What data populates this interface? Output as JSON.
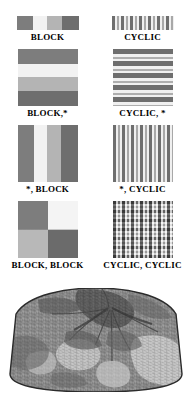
{
  "figure": {
    "background_color": "#ffffff",
    "width": 190,
    "height": 395
  },
  "pattern_grid": {
    "rows": [
      {
        "row_index": 1,
        "shape": "bar",
        "cells": [
          {
            "caption": "BLOCK",
            "boundary_type": "BLOCK",
            "axis": "1D-horizontal",
            "fill_class": "fill-block-h",
            "bands": [
              "#7d7d7d",
              "#f2f2f2",
              "#b4b4b4",
              "#6e6e6e"
            ]
          },
          {
            "caption": "CYCLIC",
            "boundary_type": "CYCLIC",
            "axis": "1D-horizontal",
            "fill_class": "fill-cyclic-h",
            "bands": [
              "#6e6e6e",
              "#efefef",
              "#a8a8a8",
              "#efefef"
            ]
          }
        ]
      },
      {
        "row_index": 2,
        "shape": "tile",
        "cells": [
          {
            "caption": "BLOCK,*",
            "boundary_type": "BLOCK",
            "axis": "vertical",
            "fill_class": "fill-block-v",
            "bands": [
              "#7d7d7d",
              "#f2f2f2",
              "#b4b4b4",
              "#6e6e6e"
            ]
          },
          {
            "caption": "CYCLIC, *",
            "boundary_type": "CYCLIC",
            "axis": "vertical",
            "fill_class": "fill-cyclic-v",
            "bands": [
              "#6e6e6e",
              "#f0f0f0",
              "#aeaeae",
              "#f0f0f0"
            ]
          }
        ]
      },
      {
        "row_index": 3,
        "shape": "tile",
        "cells": [
          {
            "caption": "*, BLOCK",
            "boundary_type": "BLOCK",
            "axis": "horizontal",
            "fill_class": "fill-block-h",
            "bands": [
              "#7d7d7d",
              "#f2f2f2",
              "#b4b4b4",
              "#6e6e6e"
            ]
          },
          {
            "caption": "*, CYCLIC",
            "boundary_type": "CYCLIC",
            "axis": "horizontal",
            "fill_class": "fill-cyclic-h",
            "bands": [
              "#6e6e6e",
              "#efefef",
              "#a8a8a8",
              "#efefef"
            ]
          }
        ]
      },
      {
        "row_index": 4,
        "shape": "tile",
        "cells": [
          {
            "caption": "BLOCK, BLOCK",
            "boundary_type": "BLOCK",
            "axis": "both",
            "fill_class": "fill-block-block",
            "quadrants": [
              "#7d7d7d",
              "#f4f4f4",
              "#b8b8b8",
              "#6b6b6b"
            ]
          },
          {
            "caption": "CYCLIC, CYCLIC",
            "boundary_type": "CYCLIC",
            "axis": "both",
            "fill_class": "fill-cyclic-cyclic",
            "base_color": "#9d9d9d"
          }
        ]
      }
    ]
  },
  "micrograph": {
    "description": "grain-structure micrograph",
    "shape": "dome",
    "base_color": "#8e8e8e",
    "dark_color": "#3a3a3a",
    "light_color": "#e3e3e3",
    "outline_color": "#2b2b2b"
  }
}
